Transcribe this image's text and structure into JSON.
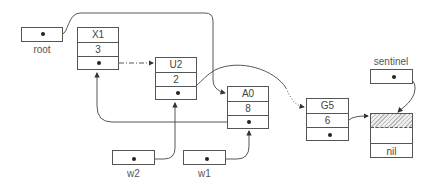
{
  "diagram": {
    "type": "linked-list-pointer-diagram",
    "variables": {
      "root": {
        "label": "root"
      },
      "sentinel": {
        "label": "sentinel"
      },
      "w2": {
        "label": "w2"
      },
      "w1": {
        "label": "w1"
      }
    },
    "nodes": [
      {
        "id": "X1",
        "key": "X1",
        "value": "3"
      },
      {
        "id": "U2",
        "key": "U2",
        "value": "2"
      },
      {
        "id": "A0",
        "key": "A0",
        "value": "8"
      },
      {
        "id": "G5",
        "key": "G5",
        "value": "6"
      },
      {
        "id": "sentinel-node",
        "key": "",
        "value": "",
        "extra": "nil"
      }
    ],
    "edges": [
      {
        "from": "root",
        "to": "A0",
        "style": "solid"
      },
      {
        "from": "X1.next",
        "to": "U2",
        "style": "dash-dot"
      },
      {
        "from": "U2.next",
        "to": "G5",
        "style": "solid-then-dotted"
      },
      {
        "from": "A0.next",
        "to": "X1",
        "style": "solid"
      },
      {
        "from": "G5.next",
        "to": "sentinel-node",
        "style": "solid"
      },
      {
        "from": "sentinel",
        "to": "sentinel-node",
        "style": "solid"
      },
      {
        "from": "w2",
        "to": "U2",
        "style": "solid"
      },
      {
        "from": "w1",
        "to": "A0",
        "style": "solid"
      }
    ]
  }
}
